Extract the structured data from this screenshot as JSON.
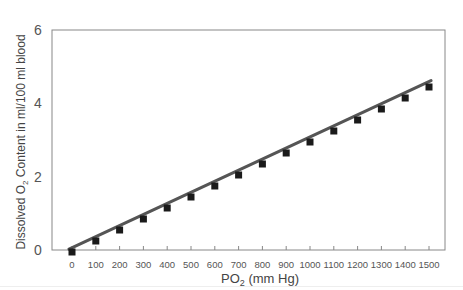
{
  "chart_data": {
    "type": "scatter",
    "title": "",
    "xlabel": "PO2 (mm Hg)",
    "xlabel_main": "PO",
    "xlabel_sub": "2",
    "xlabel_tail": " (mm Hg)",
    "ylabel": "Dissolved O2 Content in ml/100 ml blood",
    "ylabel_pre": "Dissolved O",
    "ylabel_sub": "2",
    "ylabel_tail": " Content in ml/100 ml blood",
    "xlim": [
      0,
      1500
    ],
    "ylim": [
      0,
      6
    ],
    "x_ticks": [
      0,
      100,
      200,
      300,
      400,
      500,
      600,
      700,
      800,
      900,
      1000,
      1100,
      1200,
      1300,
      1400,
      1500
    ],
    "y_ticks": [
      0,
      2,
      4,
      6
    ],
    "grid": false,
    "legend": null,
    "series": [
      {
        "name": "Measured",
        "marker": "square",
        "x": [
          0,
          100,
          200,
          300,
          400,
          500,
          600,
          700,
          800,
          900,
          1000,
          1100,
          1200,
          1300,
          1400,
          1500
        ],
        "y": [
          0.0,
          0.3,
          0.6,
          0.9,
          1.2,
          1.5,
          1.8,
          2.1,
          2.4,
          2.7,
          3.0,
          3.3,
          3.6,
          3.9,
          4.2,
          4.5
        ]
      },
      {
        "name": "Linear fit",
        "type": "line",
        "x": [
          0,
          1500
        ],
        "y": [
          0.05,
          4.62
        ]
      }
    ],
    "colors": {
      "line": "#555555",
      "marker": "#1a1a1a",
      "frame": "#888888",
      "text": "#555555"
    }
  }
}
